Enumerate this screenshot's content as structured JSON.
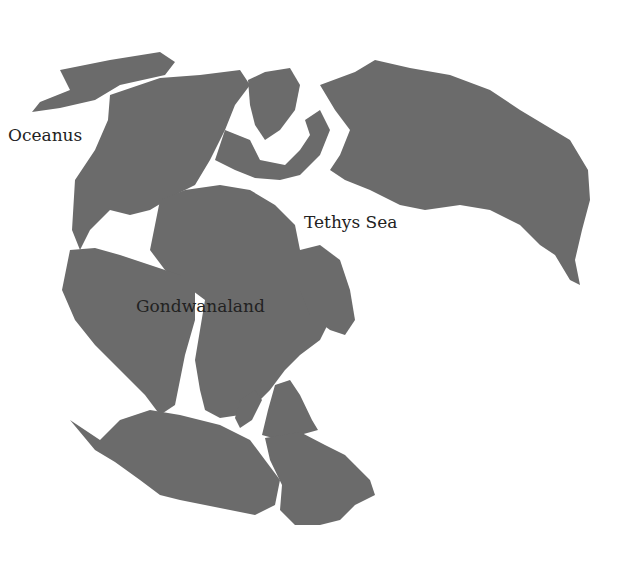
{
  "map": {
    "title": "Pangaea",
    "land_color": "#6b6b6b",
    "ocean_color": "#ffffff",
    "labels": {
      "oceanus": "Oceanus",
      "tethys": "Tethys Sea",
      "gondwanaland": "Gondwanaland"
    }
  }
}
